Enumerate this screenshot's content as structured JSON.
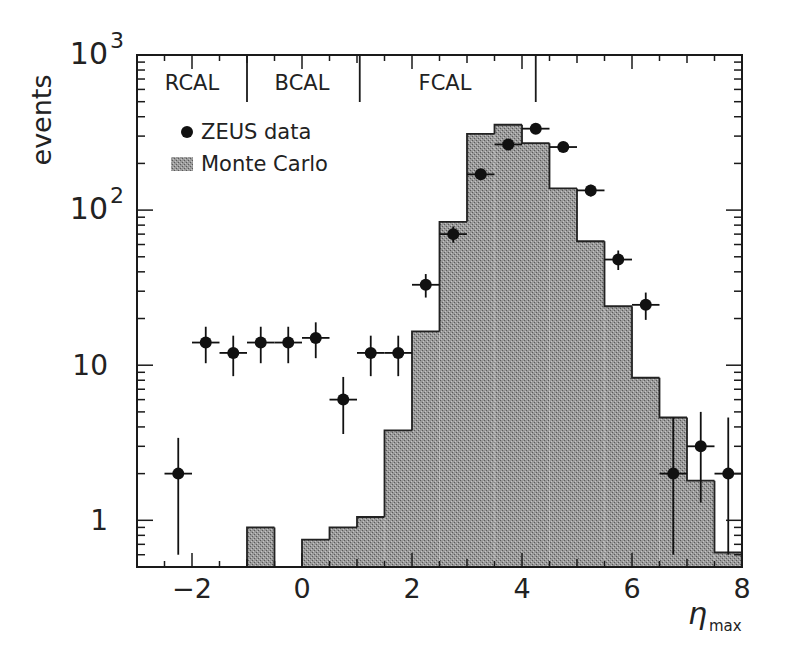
{
  "chart_data": {
    "type": "bar",
    "subtype": "histogram-with-errorbar-points",
    "title": "",
    "xlabel": "η_max",
    "xlabel_main": "η",
    "xlabel_sub": "max",
    "ylabel": "events",
    "yscale": "log",
    "xlim": [
      -3,
      8
    ],
    "ylim": [
      0.5,
      1000
    ],
    "grid": false,
    "x_ticks": [
      -2,
      0,
      2,
      4,
      6,
      8
    ],
    "x_tick_labels": [
      "−2",
      "0",
      "2",
      "4",
      "6",
      "8"
    ],
    "y_ticks": [
      1,
      10,
      100,
      1000
    ],
    "y_tick_labels": [
      {
        "base": "1",
        "exp": ""
      },
      {
        "base": "10",
        "exp": ""
      },
      {
        "base": "10",
        "exp": "2"
      },
      {
        "base": "10",
        "exp": "3"
      }
    ],
    "legend": {
      "position": "upper-left",
      "entries": [
        {
          "label": "ZEUS data",
          "marker": "filled-circle"
        },
        {
          "label": "Monte Carlo",
          "marker": "hatched-box"
        }
      ]
    },
    "annotations": [
      {
        "text": "RCAL",
        "x_center": -2.0
      },
      {
        "text": "BCAL",
        "x_center": 0.0
      },
      {
        "text": "FCAL",
        "x_center": 2.6
      }
    ],
    "region_dividers_x": [
      -1.0,
      1.05,
      4.25
    ],
    "series": [
      {
        "name": "Monte Carlo",
        "kind": "histogram",
        "bin_edges": [
          -3.0,
          -2.5,
          -2.0,
          -1.5,
          -1.0,
          -0.5,
          0.0,
          0.5,
          1.0,
          1.5,
          2.0,
          2.5,
          3.0,
          3.5,
          4.0,
          4.5,
          5.0,
          5.5,
          6.0,
          6.5,
          7.0,
          7.5,
          8.0
        ],
        "values": [
          0,
          0,
          0,
          0,
          0.9,
          0,
          0.75,
          0.9,
          1.05,
          3.8,
          16.5,
          84,
          310,
          355,
          270,
          138,
          63,
          24,
          8.3,
          4.6,
          1.8,
          0.62
        ],
        "color": "#8a8a8a"
      },
      {
        "name": "ZEUS data",
        "kind": "points-with-errors",
        "x": [
          -2.25,
          -1.75,
          -1.25,
          -0.75,
          -0.25,
          0.25,
          0.75,
          1.25,
          1.75,
          2.25,
          2.75,
          3.25,
          3.75,
          4.25,
          4.75,
          5.25,
          5.75,
          6.25,
          6.75,
          7.25,
          7.75
        ],
        "values": [
          2,
          14,
          12,
          14,
          14,
          15,
          6,
          12,
          12,
          33,
          70,
          170,
          265,
          335,
          255,
          134,
          48,
          24.5,
          2,
          3,
          2
        ],
        "err_low": [
          1.4,
          3.7,
          3.5,
          3.7,
          3.7,
          3.9,
          2.4,
          3.5,
          3.5,
          5.7,
          8.4,
          13,
          16,
          18,
          16,
          11.6,
          6.9,
          4.9,
          1.4,
          1.7,
          1.4
        ],
        "err_high": [
          1.4,
          3.7,
          3.5,
          3.7,
          3.7,
          3.9,
          2.4,
          3.5,
          3.5,
          5.7,
          8.4,
          13,
          16,
          18,
          16,
          11.6,
          6.9,
          4.9,
          2.6,
          2.0,
          2.6
        ],
        "x_halfwidth": 0.25,
        "color": "#000000"
      }
    ]
  }
}
